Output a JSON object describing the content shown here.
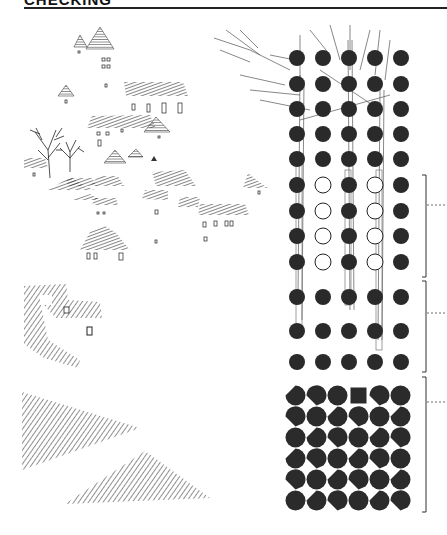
{
  "header": {
    "title": "CHECKING",
    "title_clipped": true
  },
  "illustrations": {
    "village_sketch": {
      "description": "hatched rooftops, triangle roofs, small windows and bare trees"
    },
    "roof_detail": {
      "description": "hatched roof with dormer and window"
    },
    "slopes": {
      "description": "two hatched triangular slopes"
    },
    "tree_over_grid": {
      "description": "bare tree branches over dot grid"
    }
  },
  "dot_grid": {
    "columns_x": [
      297,
      323,
      349,
      375,
      401
    ],
    "rows": [
      {
        "y": 58,
        "pattern": [
          "filled",
          "filled",
          "filled",
          "filled",
          "filled"
        ]
      },
      {
        "y": 84,
        "pattern": [
          "filled",
          "filled",
          "filled",
          "filled",
          "filled"
        ]
      },
      {
        "y": 109,
        "pattern": [
          "filled",
          "filled",
          "filled",
          "filled",
          "filled"
        ]
      },
      {
        "y": 134,
        "pattern": [
          "filled",
          "filled",
          "filled",
          "filled",
          "filled"
        ]
      },
      {
        "y": 159,
        "pattern": [
          "filled",
          "filled",
          "filled",
          "filled",
          "filled"
        ]
      },
      {
        "y": 185,
        "pattern": [
          "filled",
          "open",
          "filled",
          "open",
          "filled"
        ]
      },
      {
        "y": 211,
        "pattern": [
          "filled",
          "open",
          "filled",
          "open",
          "filled"
        ]
      },
      {
        "y": 236,
        "pattern": [
          "filled",
          "open",
          "filled",
          "open",
          "filled"
        ]
      },
      {
        "y": 262,
        "pattern": [
          "filled",
          "open",
          "filled",
          "open",
          "filled"
        ]
      },
      {
        "y": 297,
        "pattern": [
          "filled",
          "filled",
          "filled",
          "filled",
          "filled"
        ]
      },
      {
        "y": 331,
        "pattern": [
          "filled",
          "filled",
          "filled",
          "filled",
          "filled"
        ]
      },
      {
        "y": 362,
        "pattern": [
          "filled",
          "filled",
          "filled",
          "filled",
          "filled"
        ]
      }
    ],
    "radius": 8,
    "fill_color": "#2a2a2a"
  },
  "shape_grid": {
    "origin": [
      285,
      385
    ],
    "cell": 21,
    "rows": 6,
    "cols": 6,
    "fill_color": "#2b2b2b"
  },
  "brackets": [
    {
      "top": 175,
      "bottom": 277,
      "tick_y": 205
    },
    {
      "top": 281,
      "bottom": 372,
      "tick_y": 313
    },
    {
      "top": 377,
      "bottom": 512,
      "tick_y": 402
    }
  ]
}
